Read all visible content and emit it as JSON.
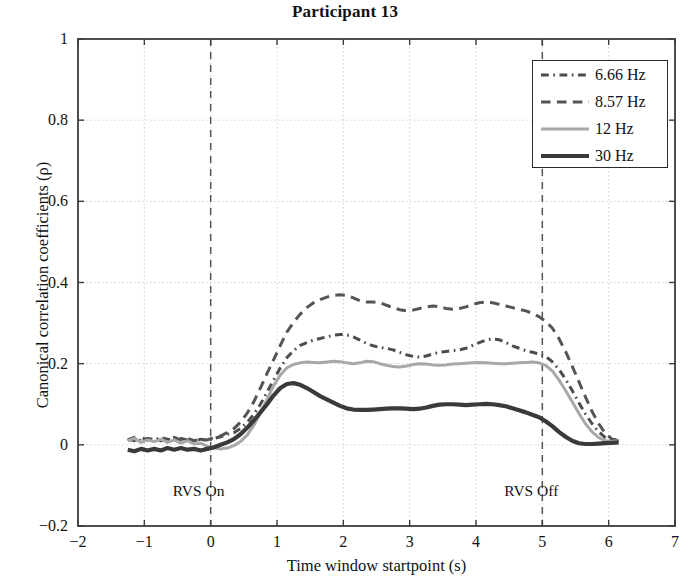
{
  "chart_data": {
    "type": "line",
    "title": "Participant 13",
    "xlabel": "Time window startpoint (s)",
    "ylabel": "Canonical correlation coefficients (ρ)",
    "xlim": [
      -2,
      7
    ],
    "ylim": [
      -0.2,
      1
    ],
    "xticks": [
      "−2",
      "−1",
      "0",
      "1",
      "2",
      "3",
      "4",
      "5",
      "6",
      "7"
    ],
    "xtick_values": [
      -2,
      -1,
      0,
      1,
      2,
      3,
      4,
      5,
      6,
      7
    ],
    "yticks": [
      "−0.2",
      "0",
      "0.2",
      "0.4",
      "0.6",
      "0.8",
      "1"
    ],
    "ytick_values": [
      -0.2,
      0,
      0.2,
      0.4,
      0.6,
      0.8,
      1
    ],
    "grid": true,
    "legend_position": "top-right",
    "annotations": [
      {
        "text": "RVS On",
        "x": 0,
        "y": -0.115,
        "line": "dashed-vertical"
      },
      {
        "text": "RVS Off",
        "x": 5,
        "y": -0.115,
        "line": "dashed-vertical"
      }
    ],
    "x": [
      -1.25,
      -1.15,
      -1.05,
      -0.95,
      -0.85,
      -0.75,
      -0.65,
      -0.55,
      -0.45,
      -0.35,
      -0.25,
      -0.15,
      -0.05,
      0.05,
      0.15,
      0.25,
      0.35,
      0.45,
      0.55,
      0.65,
      0.75,
      0.85,
      0.95,
      1.05,
      1.15,
      1.25,
      1.35,
      1.45,
      1.55,
      1.65,
      1.75,
      1.85,
      1.95,
      2.05,
      2.15,
      2.25,
      2.35,
      2.45,
      2.55,
      2.65,
      2.75,
      2.85,
      2.95,
      3.05,
      3.15,
      3.25,
      3.35,
      3.45,
      3.55,
      3.65,
      3.75,
      3.85,
      3.95,
      4.05,
      4.15,
      4.25,
      4.35,
      4.45,
      4.55,
      4.65,
      4.75,
      4.85,
      4.95,
      5.05,
      5.15,
      5.25,
      5.35,
      5.45,
      5.55,
      5.65,
      5.75,
      5.85,
      5.95,
      6.05,
      6.15
    ],
    "series": [
      {
        "name": "6.66 Hz",
        "color": "#4d4d4d",
        "dash": "dash-dot",
        "width": 3,
        "values": [
          0.012,
          0.018,
          0.01,
          0.016,
          0.012,
          0.018,
          0.014,
          0.01,
          0.016,
          0.012,
          0.008,
          0.014,
          0.01,
          0.016,
          0.02,
          0.026,
          0.03,
          0.04,
          0.055,
          0.075,
          0.1,
          0.13,
          0.16,
          0.19,
          0.215,
          0.232,
          0.245,
          0.252,
          0.258,
          0.262,
          0.266,
          0.27,
          0.272,
          0.271,
          0.266,
          0.258,
          0.25,
          0.244,
          0.24,
          0.238,
          0.234,
          0.228,
          0.222,
          0.218,
          0.216,
          0.219,
          0.224,
          0.228,
          0.23,
          0.232,
          0.234,
          0.238,
          0.245,
          0.252,
          0.258,
          0.261,
          0.259,
          0.252,
          0.244,
          0.238,
          0.232,
          0.228,
          0.224,
          0.218,
          0.205,
          0.186,
          0.162,
          0.134,
          0.104,
          0.076,
          0.052,
          0.032,
          0.018,
          0.012,
          0.01
        ]
      },
      {
        "name": "8.57 Hz",
        "color": "#555555",
        "dash": "dashed",
        "width": 3,
        "values": [
          0.014,
          0.01,
          0.018,
          0.012,
          0.016,
          0.01,
          0.014,
          0.018,
          0.012,
          0.016,
          0.01,
          0.014,
          0.012,
          0.018,
          0.022,
          0.03,
          0.04,
          0.056,
          0.078,
          0.106,
          0.14,
          0.176,
          0.21,
          0.245,
          0.278,
          0.302,
          0.322,
          0.338,
          0.35,
          0.358,
          0.364,
          0.368,
          0.37,
          0.368,
          0.362,
          0.355,
          0.352,
          0.352,
          0.35,
          0.344,
          0.338,
          0.333,
          0.33,
          0.332,
          0.336,
          0.34,
          0.342,
          0.34,
          0.336,
          0.334,
          0.336,
          0.34,
          0.346,
          0.35,
          0.352,
          0.35,
          0.346,
          0.342,
          0.338,
          0.334,
          0.33,
          0.324,
          0.316,
          0.304,
          0.288,
          0.262,
          0.23,
          0.194,
          0.156,
          0.118,
          0.082,
          0.052,
          0.028,
          0.014,
          0.012
        ]
      },
      {
        "name": "12 Hz",
        "color": "#a8a8a8",
        "dash": "solid",
        "width": 3,
        "values": [
          0.01,
          0.016,
          0.006,
          0.012,
          0.008,
          0.014,
          0.006,
          0.012,
          0.004,
          0.01,
          0.002,
          0.004,
          -0.004,
          -0.008,
          -0.01,
          -0.008,
          -0.002,
          0.008,
          0.024,
          0.048,
          0.078,
          0.112,
          0.146,
          0.172,
          0.19,
          0.198,
          0.202,
          0.204,
          0.203,
          0.202,
          0.204,
          0.206,
          0.205,
          0.202,
          0.2,
          0.202,
          0.206,
          0.205,
          0.2,
          0.196,
          0.193,
          0.192,
          0.194,
          0.198,
          0.2,
          0.199,
          0.197,
          0.196,
          0.197,
          0.199,
          0.2,
          0.201,
          0.202,
          0.203,
          0.202,
          0.201,
          0.2,
          0.2,
          0.201,
          0.202,
          0.203,
          0.204,
          0.202,
          0.196,
          0.182,
          0.16,
          0.134,
          0.106,
          0.078,
          0.052,
          0.032,
          0.018,
          0.01,
          0.008,
          0.01
        ]
      },
      {
        "name": "30 Hz",
        "color": "#3a3a3a",
        "dash": "solid",
        "width": 4.2,
        "values": [
          -0.012,
          -0.016,
          -0.01,
          -0.014,
          -0.01,
          -0.014,
          -0.008,
          -0.012,
          -0.008,
          -0.012,
          -0.01,
          -0.014,
          -0.01,
          -0.006,
          0.0,
          0.006,
          0.014,
          0.026,
          0.042,
          0.06,
          0.08,
          0.1,
          0.122,
          0.14,
          0.15,
          0.152,
          0.148,
          0.14,
          0.13,
          0.12,
          0.112,
          0.104,
          0.096,
          0.09,
          0.087,
          0.086,
          0.086,
          0.087,
          0.088,
          0.089,
          0.09,
          0.09,
          0.089,
          0.088,
          0.089,
          0.092,
          0.096,
          0.099,
          0.1,
          0.1,
          0.099,
          0.098,
          0.099,
          0.1,
          0.101,
          0.1,
          0.098,
          0.095,
          0.09,
          0.085,
          0.08,
          0.074,
          0.068,
          0.058,
          0.046,
          0.032,
          0.02,
          0.01,
          0.004,
          0.002,
          0.002,
          0.003,
          0.004,
          0.005,
          0.006
        ]
      }
    ]
  },
  "legend": {
    "items": [
      {
        "label": "6.66 Hz"
      },
      {
        "label": "8.57 Hz"
      },
      {
        "label": "12 Hz"
      },
      {
        "label": "30 Hz"
      }
    ]
  }
}
